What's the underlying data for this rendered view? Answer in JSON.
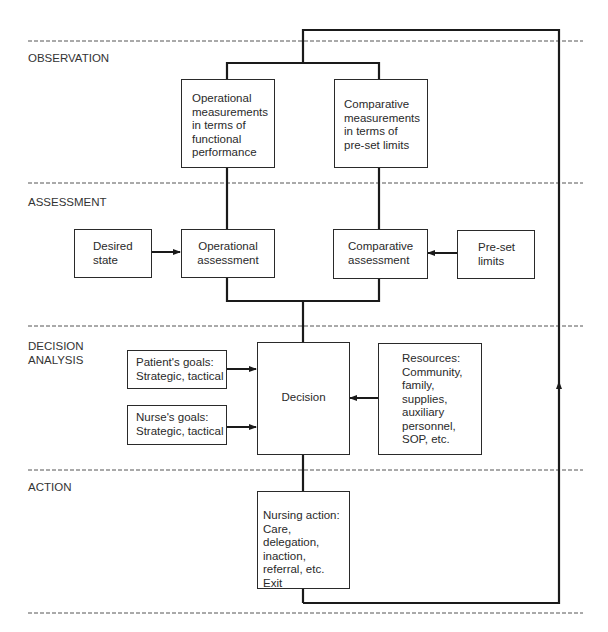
{
  "stages": [
    {
      "id": "observation",
      "label": "OBSERVATION"
    },
    {
      "id": "assessment",
      "label": "ASSESSMENT"
    },
    {
      "id": "decision_analysis",
      "label": "DECISION\nANALYSIS"
    },
    {
      "id": "action",
      "label": "ACTION"
    }
  ],
  "boxes": {
    "operational_measurements": "Operational\nmeasurements\nin terms of\nfunctional\nperformance",
    "comparative_measurements": "Comparative\nmeasurements\nin terms of\npre-set limits",
    "desired_state": "Desired\nstate",
    "operational_assessment": "Operational\nassessment",
    "comparative_assessment": "Comparative\nassessment",
    "preset_limits": "Pre-set\nlimits",
    "patient_goals": "Patient's goals:\nStrategic, tactical",
    "nurse_goals": "Nurse's goals:\nStrategic, tactical",
    "decision": "Decision",
    "resources": "Resources:\nCommunity,\nfamily,\nsupplies,\nauxiliary\npersonnel,\nSOP, etc.",
    "nursing_action": "Nursing action:\nCare, delegation,\ninaction,\nreferral, etc.\nExit"
  },
  "colors": {
    "line": "#1a1a1a",
    "dash": "#555555",
    "text": "#2a2a2a",
    "background": "#ffffff"
  }
}
